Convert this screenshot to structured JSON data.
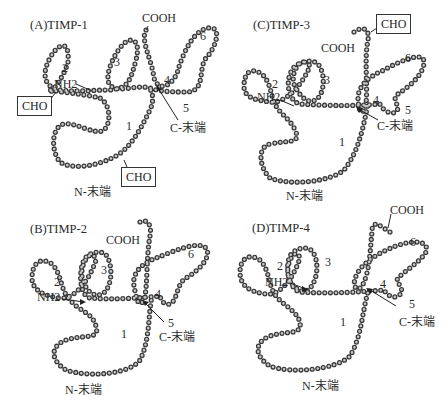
{
  "figure": {
    "panels": [
      {
        "id": "A",
        "title": "(A)TIMP-1",
        "loops": [
          "1",
          "2",
          "3",
          "4",
          "5",
          "6"
        ],
        "nh2_label": "NH2",
        "cooh_label": "COOH",
        "c_terminal_label": "C-末端",
        "n_terminal_label": "N-末端",
        "glycosylation_labels": [
          "CHO",
          "CHO"
        ]
      },
      {
        "id": "C",
        "title": "(C)TIMP-3",
        "loops": [
          "1",
          "2",
          "3",
          "4",
          "5",
          "6"
        ],
        "nh2_label": "NH2",
        "cooh_label": "COOH",
        "c_terminal_label": "C-末端",
        "n_terminal_label": "N-末端",
        "glycosylation_labels": [
          "CHO"
        ]
      },
      {
        "id": "B",
        "title": "(B)TIMP-2",
        "loops": [
          "1",
          "2",
          "3",
          "4",
          "5",
          "6"
        ],
        "nh2_label": "NH2",
        "cooh_label": "COOH",
        "c_terminal_label": "C-末端",
        "n_terminal_label": "N-末端"
      },
      {
        "id": "D",
        "title": "(D)TIMP-4",
        "loops": [
          "1",
          "2",
          "3",
          "4",
          "5",
          "6"
        ],
        "nh2_label": "NH2",
        "cooh_label": "COOH",
        "c_terminal_label": "C-末端",
        "n_terminal_label": "N-末端"
      }
    ]
  }
}
